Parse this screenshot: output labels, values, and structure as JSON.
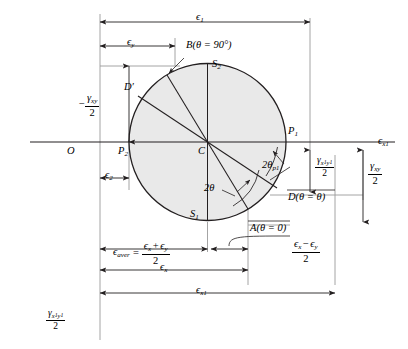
{
  "figure": {
    "colors": {
      "circle_fill": "#e9e9e9",
      "line": "#231f20",
      "background": "#ffffff"
    }
  },
  "axes": {
    "horizontal_axis_label": "ϵ",
    "horizontal_axis_sub": "x",
    "horizontal_axis_subsub": "1",
    "vertical_axis_numerator": "γ",
    "vertical_axis_num_sub": "x",
    "vertical_axis_num_subsub": "1",
    "vertical_axis_num_sub2": "y",
    "vertical_axis_num_subsub2": "1",
    "vertical_axis_denominator": "2",
    "origin_label": "O"
  },
  "points": {
    "center": "C",
    "p1": "P",
    "p1_sub": "1",
    "p2": "P",
    "p2_sub": "2",
    "s1": "S",
    "s1_sub": "1",
    "s2": "S",
    "s2_sub": "2",
    "point_a": "A(θ = 0)",
    "point_b": "B(θ = 90°)",
    "point_d": "D(θ = θ)",
    "point_dprime": "D′"
  },
  "angles": {
    "two_theta": "2θ",
    "two_theta_p1": "2θ",
    "two_theta_p1_sub": "p",
    "two_theta_p1_subsub": "1"
  },
  "dimensions": {
    "epsilon_1": {
      "sym": "ϵ",
      "sub": "1"
    },
    "epsilon_2": {
      "sym": "ϵ",
      "sub": "2"
    },
    "epsilon_x": {
      "sym": "ϵ",
      "sub": "x"
    },
    "epsilon_y": {
      "sym": "ϵ",
      "sub": "y"
    },
    "epsilon_x1": {
      "sym": "ϵ",
      "sub": "x",
      "subsub": "1"
    },
    "epsilon_aver": {
      "sym": "ϵ",
      "sub": "aver"
    },
    "equals": "=",
    "aver_num_a": "ϵ",
    "aver_num_a_sub": "x",
    "aver_plus": "+",
    "aver_num_b": "ϵ",
    "aver_num_b_sub": "y",
    "aver_den": "2",
    "diff_num_a": "ϵ",
    "diff_num_a_sub": "x",
    "diff_minus": "−",
    "diff_num_b": "ϵ",
    "diff_num_b_sub": "y",
    "diff_den": "2",
    "neg_gamma_xy_half": {
      "sign": "−",
      "num": "γ",
      "num_sub": "xy",
      "den": "2"
    },
    "gamma_x1y1_half": {
      "num": "γ",
      "num_sub1": "x",
      "num_subsub1": "1",
      "num_sub2": "y",
      "num_subsub2": "1",
      "den": "2"
    },
    "gamma_xy_half": {
      "num": "γ",
      "num_sub": "xy",
      "den": "2"
    }
  },
  "geometry": {
    "circle_center_x": 207.5,
    "circle_center_y": 142,
    "circle_radius": 78.5,
    "axis_y": 142,
    "origin_x": 57,
    "vertical_ref_x": 100
  }
}
